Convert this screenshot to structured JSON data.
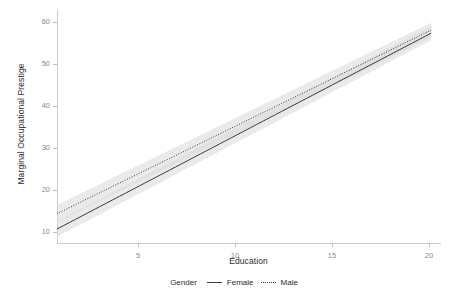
{
  "chart_data": {
    "type": "line",
    "title": "",
    "xlabel": "Education",
    "ylabel": "Marginal Occupational Prestige",
    "xlim": [
      1,
      20.5
    ],
    "ylim": [
      8.2,
      61.5
    ],
    "xticks": [
      5,
      10,
      15,
      20
    ],
    "yticks": [
      10,
      20,
      30,
      40,
      50,
      60
    ],
    "grid": false,
    "legend_title": "Gender",
    "legend_position": "bottom",
    "band_color": "#d9d9d9",
    "line_color": "#3b3b3b",
    "series": [
      {
        "name": "Female",
        "linestyle": "solid",
        "x": [
          1,
          20
        ],
        "values": [
          11.4,
          56.2
        ],
        "ci_lower": [
          9.6,
          54.6
        ],
        "ci_upper": [
          13.2,
          57.8
        ]
      },
      {
        "name": "Male",
        "linestyle": "dotted",
        "x": [
          1,
          20
        ],
        "values": [
          14.9,
          56.9
        ],
        "ci_lower": [
          12.9,
          55.2
        ],
        "ci_upper": [
          16.9,
          58.6
        ]
      }
    ]
  },
  "axes": {
    "x_title": "Education",
    "y_title": "Marginal Occupational Prestige",
    "x_tick_labels": [
      "5",
      "10",
      "15",
      "20"
    ],
    "y_tick_labels": [
      "10",
      "20",
      "30",
      "40",
      "50",
      "60"
    ]
  },
  "legend": {
    "title": "Gender",
    "items": [
      {
        "label": "Female"
      },
      {
        "label": "Male"
      }
    ]
  }
}
